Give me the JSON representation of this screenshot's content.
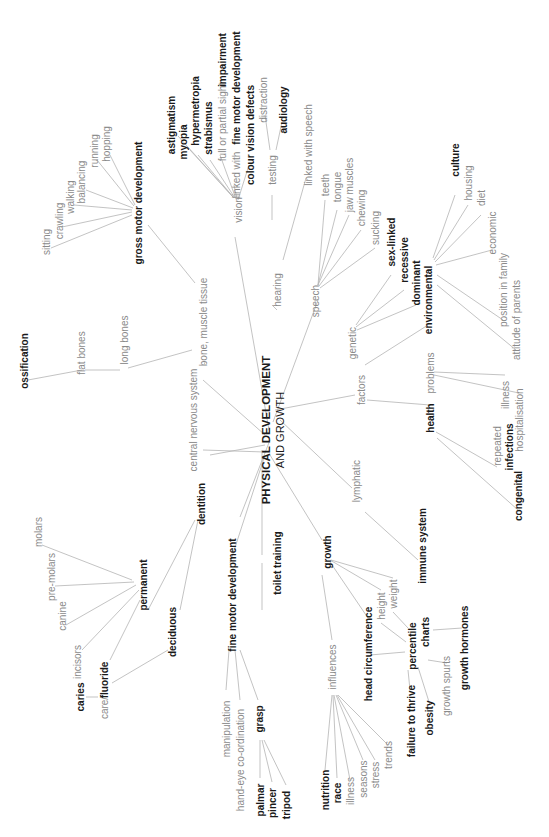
{
  "center": {
    "line1": "PHYSICAL DEVELOPMENT",
    "line2": "AND GROWTH"
  },
  "nodes": [
    {
      "id": "vision",
      "label": "vision",
      "x": 238,
      "y": 210,
      "bold": false
    },
    {
      "id": "astigmatism",
      "label": "astigmatism",
      "x": 171,
      "y": 125,
      "bold": true
    },
    {
      "id": "myopia",
      "label": "myopia",
      "x": 183,
      "y": 142,
      "bold": true
    },
    {
      "id": "hypermetropia",
      "label": "hypermetropia",
      "x": 195,
      "y": 111,
      "bold": true
    },
    {
      "id": "strabismus",
      "label": "strabismus",
      "x": 208,
      "y": 128,
      "bold": true
    },
    {
      "id": "full-sight",
      "label": "full or partial sight",
      "x": 222,
      "y": 122,
      "bold": false
    },
    {
      "id": "impairment",
      "label": "impairment",
      "x": 222,
      "y": 60,
      "bold": true
    },
    {
      "id": "linked-with",
      "label": "linked with",
      "x": 236,
      "y": 175,
      "bold": false
    },
    {
      "id": "fine-motor-link",
      "label": "fine motor development",
      "x": 236,
      "y": 88,
      "bold": true
    },
    {
      "id": "colour-vision",
      "label": "colour vision defects",
      "x": 250,
      "y": 135,
      "bold": true
    },
    {
      "id": "hearing",
      "label": "hearing",
      "x": 277,
      "y": 290,
      "bold": false
    },
    {
      "id": "testing",
      "label": "testing",
      "x": 272,
      "y": 170,
      "bold": false
    },
    {
      "id": "distraction",
      "label": "distraction",
      "x": 263,
      "y": 100,
      "bold": false
    },
    {
      "id": "audiology",
      "label": "audiology",
      "x": 283,
      "y": 110,
      "bold": true
    },
    {
      "id": "linked-speech",
      "label": "linked with speech",
      "x": 308,
      "y": 145,
      "bold": false
    },
    {
      "id": "speech",
      "label": "speech",
      "x": 315,
      "y": 301,
      "bold": false
    },
    {
      "id": "teeth",
      "label": "teeth",
      "x": 325,
      "y": 185,
      "bold": false
    },
    {
      "id": "tongue",
      "label": "tongue",
      "x": 337,
      "y": 187,
      "bold": false
    },
    {
      "id": "jaw-muscles",
      "label": "jaw muscles",
      "x": 349,
      "y": 185,
      "bold": false
    },
    {
      "id": "chewing",
      "label": "chewing",
      "x": 361,
      "y": 208,
      "bold": false
    },
    {
      "id": "sucking",
      "label": "sucking",
      "x": 375,
      "y": 228,
      "bold": false
    },
    {
      "id": "sex-linked",
      "label": "sex-linked",
      "x": 391,
      "y": 242,
      "bold": true
    },
    {
      "id": "recessive",
      "label": "recessive",
      "x": 404,
      "y": 260,
      "bold": true
    },
    {
      "id": "dominant",
      "label": "dominant",
      "x": 416,
      "y": 283,
      "bold": true
    },
    {
      "id": "environmental",
      "label": "environmental",
      "x": 428,
      "y": 300,
      "bold": true
    },
    {
      "id": "genetic",
      "label": "genetic",
      "x": 352,
      "y": 343,
      "bold": false
    },
    {
      "id": "culture",
      "label": "culture",
      "x": 455,
      "y": 160,
      "bold": true
    },
    {
      "id": "housing",
      "label": "housing",
      "x": 468,
      "y": 183,
      "bold": false
    },
    {
      "id": "diet",
      "label": "diet",
      "x": 481,
      "y": 198,
      "bold": false
    },
    {
      "id": "economic",
      "label": "economic",
      "x": 492,
      "y": 233,
      "bold": false
    },
    {
      "id": "position-family",
      "label": "position in family",
      "x": 503,
      "y": 290,
      "bold": false
    },
    {
      "id": "attitude-parents",
      "label": "attitude of parents",
      "x": 516,
      "y": 320,
      "bold": false
    },
    {
      "id": "factors",
      "label": "factors",
      "x": 361,
      "y": 390,
      "bold": false
    },
    {
      "id": "health",
      "label": "health",
      "x": 430,
      "y": 418,
      "bold": true
    },
    {
      "id": "problems",
      "label": "problems",
      "x": 430,
      "y": 373,
      "bold": false
    },
    {
      "id": "illness-h",
      "label": "illness",
      "x": 505,
      "y": 395,
      "bold": false
    },
    {
      "id": "hospitalisation",
      "label": "hospitalisation",
      "x": 519,
      "y": 420,
      "bold": false
    },
    {
      "id": "repeated",
      "label": "repeated",
      "x": 497,
      "y": 446,
      "bold": false
    },
    {
      "id": "infections",
      "label": "infections",
      "x": 509,
      "y": 447,
      "bold": true
    },
    {
      "id": "congenital",
      "label": "congenital",
      "x": 518,
      "y": 496,
      "bold": true
    },
    {
      "id": "lymphatic",
      "label": "lymphatic",
      "x": 356,
      "y": 481,
      "bold": false
    },
    {
      "id": "immune-system",
      "label": "immune system",
      "x": 422,
      "y": 546,
      "bold": true
    },
    {
      "id": "growth",
      "label": "growth",
      "x": 327,
      "y": 552,
      "bold": true
    },
    {
      "id": "weight",
      "label": "weight",
      "x": 393,
      "y": 594,
      "bold": false
    },
    {
      "id": "height",
      "label": "height",
      "x": 381,
      "y": 606,
      "bold": false
    },
    {
      "id": "head-circ",
      "label": "head circumference",
      "x": 368,
      "y": 654,
      "bold": true
    },
    {
      "id": "percentile",
      "label": "percentile",
      "x": 412,
      "y": 646,
      "bold": true
    },
    {
      "id": "charts",
      "label": "charts",
      "x": 425,
      "y": 632,
      "bold": true
    },
    {
      "id": "growth-hormones",
      "label": "growth hormones",
      "x": 464,
      "y": 648,
      "bold": true
    },
    {
      "id": "growth-spurts",
      "label": "growth spurts",
      "x": 446,
      "y": 686,
      "bold": false
    },
    {
      "id": "obesity",
      "label": "obesity",
      "x": 429,
      "y": 718,
      "bold": true
    },
    {
      "id": "failure-thrive",
      "label": "failure to thrive",
      "x": 411,
      "y": 721,
      "bold": true
    },
    {
      "id": "influences",
      "label": "influences",
      "x": 332,
      "y": 667,
      "bold": false
    },
    {
      "id": "nutrition",
      "label": "nutrition",
      "x": 325,
      "y": 790,
      "bold": true
    },
    {
      "id": "race",
      "label": "race",
      "x": 337,
      "y": 793,
      "bold": true
    },
    {
      "id": "illness-g",
      "label": "illness",
      "x": 350,
      "y": 791,
      "bold": false
    },
    {
      "id": "seasons",
      "label": "seasons",
      "x": 363,
      "y": 779,
      "bold": false
    },
    {
      "id": "stress",
      "label": "stress",
      "x": 375,
      "y": 775,
      "bold": false
    },
    {
      "id": "trends",
      "label": "trends",
      "x": 388,
      "y": 755,
      "bold": false
    },
    {
      "id": "toilet-training",
      "label": "toilet training",
      "x": 277,
      "y": 563,
      "bold": true
    },
    {
      "id": "fine-motor",
      "label": "fine motor development",
      "x": 232,
      "y": 595,
      "bold": true
    },
    {
      "id": "manipulation",
      "label": "manipulation",
      "x": 226,
      "y": 729,
      "bold": false
    },
    {
      "id": "hand-eye",
      "label": "hand-eye co-ordination",
      "x": 240,
      "y": 760,
      "bold": false
    },
    {
      "id": "grasp",
      "label": "grasp",
      "x": 259,
      "y": 719,
      "bold": true
    },
    {
      "id": "palmar",
      "label": "palmar",
      "x": 260,
      "y": 800,
      "bold": true
    },
    {
      "id": "pincer",
      "label": "pincer",
      "x": 272,
      "y": 803,
      "bold": true
    },
    {
      "id": "tripod",
      "label": "tripod",
      "x": 286,
      "y": 805,
      "bold": true
    },
    {
      "id": "dentition",
      "label": "dentition",
      "x": 201,
      "y": 504,
      "bold": true
    },
    {
      "id": "permanent",
      "label": "permanent",
      "x": 143,
      "y": 585,
      "bold": true
    },
    {
      "id": "deciduous",
      "label": "deciduous",
      "x": 172,
      "y": 632,
      "bold": true
    },
    {
      "id": "molars",
      "label": "molars",
      "x": 38,
      "y": 532,
      "bold": false
    },
    {
      "id": "pre-molars",
      "label": "pre-molars",
      "x": 51,
      "y": 577,
      "bold": false
    },
    {
      "id": "canine",
      "label": "canine",
      "x": 62,
      "y": 616,
      "bold": false
    },
    {
      "id": "incisors",
      "label": "incisors",
      "x": 77,
      "y": 662,
      "bold": false
    },
    {
      "id": "caries",
      "label": "caries",
      "x": 80,
      "y": 697,
      "bold": true
    },
    {
      "id": "care",
      "label": "care/",
      "x": 104,
      "y": 708,
      "bold": false
    },
    {
      "id": "fluoride",
      "label": "fluoride",
      "x": 104,
      "y": 680,
      "bold": true
    },
    {
      "id": "central-nervous",
      "label": "central nervous system",
      "x": 193,
      "y": 420,
      "bold": false
    },
    {
      "id": "bone-muscle",
      "label": "bone, muscle tissue",
      "x": 203,
      "y": 322,
      "bold": false
    },
    {
      "id": "long-bones",
      "label": "long bones",
      "x": 124,
      "y": 340,
      "bold": false
    },
    {
      "id": "flat-bones",
      "label": "flat bones",
      "x": 81,
      "y": 353,
      "bold": false
    },
    {
      "id": "ossification",
      "label": "ossification",
      "x": 24,
      "y": 361,
      "bold": true
    },
    {
      "id": "gross-motor",
      "label": "gross motor development",
      "x": 138,
      "y": 203,
      "bold": true
    },
    {
      "id": "sitting",
      "label": "sitting",
      "x": 46,
      "y": 242,
      "bold": false
    },
    {
      "id": "crawling",
      "label": "crawling",
      "x": 59,
      "y": 221,
      "bold": false
    },
    {
      "id": "walking",
      "label": "walking",
      "x": 70,
      "y": 197,
      "bold": false
    },
    {
      "id": "balancing",
      "label": "balancing",
      "x": 81,
      "y": 182,
      "bold": false
    },
    {
      "id": "running",
      "label": "running",
      "x": 94,
      "y": 151,
      "bold": false
    },
    {
      "id": "hopping",
      "label": "hopping",
      "x": 106,
      "y": 144,
      "bold": false
    }
  ],
  "edges": [
    [
      269,
      430,
      235,
      237
    ],
    [
      272,
      305,
      277,
      310
    ],
    [
      273,
      422,
      318,
      300
    ],
    [
      275,
      410,
      355,
      395
    ],
    [
      280,
      420,
      352,
      488
    ],
    [
      270,
      455,
      322,
      540
    ],
    [
      262,
      450,
      262,
      555
    ],
    [
      240,
      517,
      270,
      440
    ],
    [
      230,
      563,
      265,
      455
    ],
    [
      203,
      450,
      265,
      452
    ],
    [
      203,
      380,
      265,
      435
    ],
    [
      210,
      455,
      265,
      445
    ],
    [
      233,
      197,
      178,
      136
    ],
    [
      233,
      197,
      190,
      150
    ],
    [
      234,
      198,
      198,
      155
    ],
    [
      235,
      198,
      210,
      160
    ],
    [
      236,
      199,
      220,
      155
    ],
    [
      237,
      199,
      234,
      185
    ],
    [
      238,
      200,
      249,
      165
    ],
    [
      272,
      220,
      272,
      195
    ],
    [
      270,
      150,
      265,
      115
    ],
    [
      276,
      150,
      282,
      122
    ],
    [
      283,
      260,
      306,
      178
    ],
    [
      318,
      285,
      325,
      200
    ],
    [
      318,
      285,
      337,
      210
    ],
    [
      318,
      285,
      349,
      215
    ],
    [
      319,
      286,
      361,
      230
    ],
    [
      320,
      288,
      375,
      248
    ],
    [
      356,
      325,
      391,
      275
    ],
    [
      356,
      327,
      404,
      290
    ],
    [
      357,
      330,
      416,
      305
    ],
    [
      365,
      365,
      428,
      325
    ],
    [
      433,
      258,
      455,
      195
    ],
    [
      434,
      260,
      468,
      205
    ],
    [
      435,
      262,
      481,
      215
    ],
    [
      436,
      265,
      492,
      250
    ],
    [
      437,
      275,
      503,
      320
    ],
    [
      437,
      285,
      516,
      350
    ],
    [
      367,
      400,
      430,
      405
    ],
    [
      434,
      372,
      505,
      375
    ],
    [
      434,
      375,
      519,
      393
    ],
    [
      436,
      432,
      497,
      467
    ],
    [
      437,
      438,
      518,
      510
    ],
    [
      365,
      512,
      418,
      560
    ],
    [
      331,
      560,
      393,
      578
    ],
    [
      330,
      560,
      381,
      590
    ],
    [
      330,
      562,
      368,
      618
    ],
    [
      393,
      612,
      408,
      628
    ],
    [
      381,
      623,
      406,
      642
    ],
    [
      370,
      655,
      405,
      652
    ],
    [
      433,
      630,
      462,
      628
    ],
    [
      428,
      660,
      447,
      663
    ],
    [
      418,
      667,
      430,
      705
    ],
    [
      408,
      670,
      410,
      690
    ],
    [
      322,
      575,
      332,
      640
    ],
    [
      332,
      695,
      325,
      770
    ],
    [
      333,
      695,
      337,
      778
    ],
    [
      334,
      695,
      350,
      780
    ],
    [
      336,
      695,
      363,
      760
    ],
    [
      337,
      695,
      375,
      760
    ],
    [
      338,
      695,
      388,
      745
    ],
    [
      262,
      563,
      262,
      610
    ],
    [
      229,
      650,
      226,
      690
    ],
    [
      235,
      650,
      240,
      700
    ],
    [
      240,
      650,
      258,
      700
    ],
    [
      260,
      740,
      260,
      778
    ],
    [
      262,
      740,
      272,
      782
    ],
    [
      264,
      740,
      286,
      785
    ],
    [
      195,
      520,
      148,
      610
    ],
    [
      198,
      520,
      180,
      610
    ],
    [
      132,
      580,
      42,
      545
    ],
    [
      134,
      582,
      55,
      586
    ],
    [
      136,
      585,
      66,
      625
    ],
    [
      139,
      590,
      82,
      650
    ],
    [
      140,
      600,
      110,
      660
    ],
    [
      168,
      650,
      112,
      683
    ],
    [
      86,
      697,
      98,
      697
    ],
    [
      204,
      365,
      205,
      362
    ],
    [
      192,
      350,
      128,
      368
    ],
    [
      120,
      370,
      85,
      370
    ],
    [
      82,
      370,
      28,
      380
    ],
    [
      195,
      283,
      148,
      225
    ],
    [
      132,
      215,
      51,
      248
    ],
    [
      132,
      212,
      62,
      227
    ],
    [
      132,
      210,
      74,
      205
    ],
    [
      133,
      208,
      86,
      190
    ],
    [
      134,
      206,
      97,
      160
    ],
    [
      135,
      205,
      110,
      155
    ]
  ],
  "colors": {
    "line": "#b4b4b4",
    "text_light": "#8a8a8a",
    "text_bold": "#1a1a1a",
    "background": "#ffffff"
  }
}
